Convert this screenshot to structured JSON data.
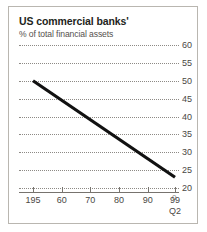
{
  "chart_data": {
    "type": "line",
    "title": "US commercial banks'",
    "subtitle": "% of total financial assets",
    "xlabel": "",
    "ylabel": "",
    "grid": true,
    "legend": null,
    "ylim": [
      20,
      60
    ],
    "ytick_labels": [
      "60",
      "55",
      "50",
      "45",
      "40",
      "35",
      "30",
      "25",
      "20"
    ],
    "ytick_values": [
      60,
      55,
      50,
      45,
      40,
      35,
      30,
      25,
      20
    ],
    "y_axis_footnote": "0",
    "xtick_labels": [
      "195",
      "60",
      "70",
      "80",
      "90",
      "99"
    ],
    "xtick_sublabel": "Q2",
    "xtick_sublabel_index": 5,
    "series": [
      {
        "name": "US commercial banks share of total financial assets",
        "x": [
          1950,
          1999.5
        ],
        "values": [
          50,
          23
        ]
      }
    ],
    "line_color": "#111111",
    "grid_color": "#8d8a85",
    "axis_color": "#77736e",
    "border_color": "#b9b6b0",
    "background": "#ffffff"
  }
}
